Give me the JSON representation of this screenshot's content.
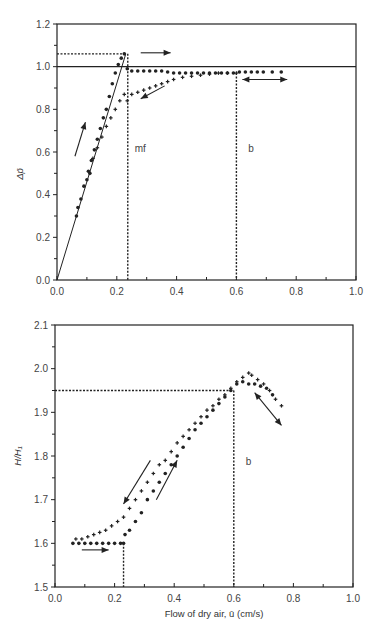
{
  "chart_data": [
    {
      "type": "scatter",
      "title": "",
      "xlabel": "",
      "ylabel": "Δp̄",
      "xlim": [
        0.0,
        1.0
      ],
      "ylim": [
        0.0,
        1.2
      ],
      "xticks": [
        "0.0",
        "0.2",
        "0.4",
        "0.6",
        "0.8",
        "1.0"
      ],
      "yticks": [
        "0.0",
        "0.2",
        "0.4",
        "0.6",
        "0.8",
        "1.0",
        "1.2"
      ],
      "grid": false,
      "annotations": [
        {
          "text": "mf",
          "x": 0.26,
          "y": 0.6
        },
        {
          "text": "b",
          "x": 0.64,
          "y": 0.6
        }
      ],
      "reference_lines": {
        "horizontal_solid": 1.0,
        "horizontal_dashed_peak": 1.06,
        "vertical_dashed_mf": 0.23,
        "vertical_dashed_b": 0.6,
        "fit_line": [
          [
            0.0,
            0.0
          ],
          [
            0.23,
            1.06
          ]
        ]
      },
      "series": [
        {
          "name": "increasing flow (dots)",
          "x": [
            0.065,
            0.07,
            0.08,
            0.09,
            0.1,
            0.105,
            0.11,
            0.115,
            0.125,
            0.135,
            0.145,
            0.155,
            0.165,
            0.175,
            0.185,
            0.195,
            0.205,
            0.215,
            0.225,
            0.235,
            0.25,
            0.27,
            0.29,
            0.31,
            0.33,
            0.35,
            0.37,
            0.39,
            0.41,
            0.43,
            0.45,
            0.47,
            0.49,
            0.51,
            0.53,
            0.55,
            0.57,
            0.59,
            0.61,
            0.63,
            0.65,
            0.67,
            0.69,
            0.72,
            0.75
          ],
          "values": [
            0.3,
            0.34,
            0.38,
            0.44,
            0.47,
            0.51,
            0.5,
            0.56,
            0.61,
            0.66,
            0.71,
            0.76,
            0.8,
            0.86,
            0.92,
            0.97,
            1.01,
            1.04,
            1.06,
            0.99,
            0.98,
            0.98,
            0.98,
            0.98,
            0.98,
            0.98,
            0.975,
            0.97,
            0.97,
            0.97,
            0.97,
            0.97,
            0.97,
            0.97,
            0.97,
            0.97,
            0.97,
            0.97,
            0.975,
            0.975,
            0.975,
            0.975,
            0.975,
            0.975,
            0.975
          ]
        },
        {
          "name": "decreasing flow (crosses)",
          "x": [
            0.12,
            0.135,
            0.15,
            0.165,
            0.18,
            0.195,
            0.21,
            0.225,
            0.235,
            0.25,
            0.27,
            0.29,
            0.31,
            0.33,
            0.35,
            0.37,
            0.39,
            0.42,
            0.45,
            0.48,
            0.51,
            0.54,
            0.57,
            0.6
          ],
          "values": [
            0.57,
            0.62,
            0.67,
            0.72,
            0.76,
            0.8,
            0.84,
            0.87,
            0.84,
            0.87,
            0.88,
            0.89,
            0.9,
            0.91,
            0.92,
            0.93,
            0.94,
            0.95,
            0.955,
            0.96,
            0.965,
            0.97,
            0.97,
            0.97
          ]
        }
      ]
    },
    {
      "type": "scatter",
      "title": "",
      "xlabel": "Flow of dry air, ū (cm/s)",
      "ylabel": "H/H₁",
      "xlim": [
        0.0,
        1.0
      ],
      "ylim": [
        1.5,
        2.1
      ],
      "xticks": [
        "0.0",
        "0.2",
        "0.4",
        "0.6",
        "0.8",
        "1.0"
      ],
      "yticks": [
        "1.5",
        "1.6",
        "1.7",
        "1.8",
        "1.9",
        "2.0",
        "2.1"
      ],
      "grid": false,
      "annotations": [
        {
          "text": "b",
          "x": 0.64,
          "y": 1.78
        }
      ],
      "reference_lines": {
        "horizontal_dashed": 1.95,
        "vertical_dashed_b": 0.6,
        "vertical_dashed_mf": 0.23
      },
      "series": [
        {
          "name": "increasing flow (dots)",
          "x": [
            0.06,
            0.08,
            0.1,
            0.12,
            0.14,
            0.16,
            0.18,
            0.2,
            0.22,
            0.23,
            0.235,
            0.25,
            0.27,
            0.29,
            0.31,
            0.33,
            0.35,
            0.37,
            0.39,
            0.41,
            0.43,
            0.45,
            0.47,
            0.49,
            0.51,
            0.53,
            0.55,
            0.57,
            0.59,
            0.61,
            0.63,
            0.65,
            0.67,
            0.69,
            0.71,
            0.73
          ],
          "values": [
            1.6,
            1.6,
            1.6,
            1.6,
            1.6,
            1.6,
            1.6,
            1.6,
            1.6,
            1.6,
            1.62,
            1.63,
            1.65,
            1.67,
            1.7,
            1.72,
            1.74,
            1.76,
            1.78,
            1.8,
            1.82,
            1.84,
            1.86,
            1.875,
            1.89,
            1.905,
            1.92,
            1.935,
            1.95,
            1.965,
            1.97,
            1.965,
            1.965,
            1.96,
            1.955,
            1.94
          ]
        },
        {
          "name": "decreasing flow (crosses)",
          "x": [
            0.07,
            0.09,
            0.11,
            0.13,
            0.15,
            0.17,
            0.19,
            0.21,
            0.23,
            0.25,
            0.27,
            0.29,
            0.31,
            0.33,
            0.35,
            0.37,
            0.39,
            0.41,
            0.43,
            0.45,
            0.47,
            0.49,
            0.51,
            0.53,
            0.55,
            0.57,
            0.59,
            0.61,
            0.63,
            0.65,
            0.66,
            0.68,
            0.7,
            0.72,
            0.74,
            0.76
          ],
          "values": [
            1.61,
            1.61,
            1.615,
            1.62,
            1.625,
            1.63,
            1.64,
            1.65,
            1.66,
            1.68,
            1.7,
            1.72,
            1.74,
            1.76,
            1.78,
            1.79,
            1.81,
            1.83,
            1.845,
            1.86,
            1.875,
            1.89,
            1.905,
            1.915,
            1.93,
            1.94,
            1.955,
            1.97,
            1.98,
            1.99,
            1.985,
            1.975,
            1.965,
            1.95,
            1.93,
            1.915
          ]
        }
      ]
    }
  ],
  "caption_fragment": ""
}
